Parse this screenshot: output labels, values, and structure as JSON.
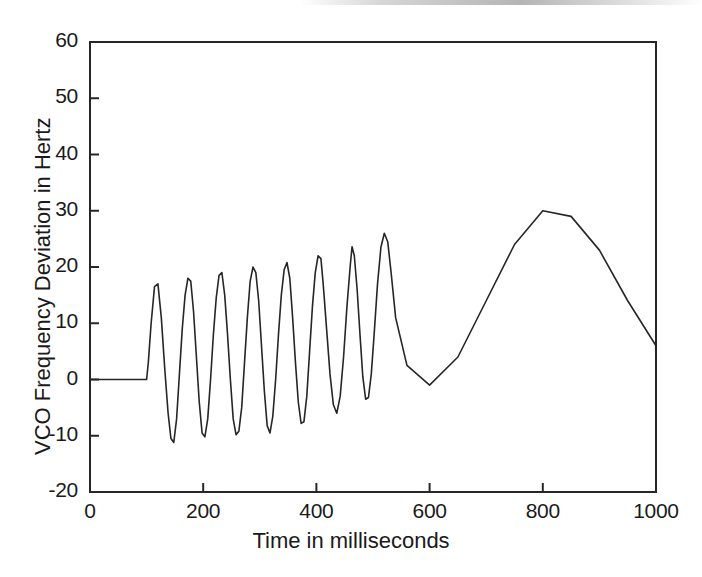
{
  "figure": {
    "width": 702,
    "height": 577,
    "background": "#ffffff",
    "line_color": "#262626",
    "axis_color": "#262626"
  },
  "chart_data": {
    "type": "line",
    "title": "",
    "xlabel": "Time in milliseconds",
    "ylabel": "VCO Frequency Deviation in Hertz",
    "xlim": [
      0,
      1000
    ],
    "ylim": [
      -20,
      60
    ],
    "xticks": [
      0,
      200,
      400,
      600,
      800,
      1000
    ],
    "xtick_labels": [
      "0",
      "200",
      "400",
      "600",
      "800",
      "1000"
    ],
    "yticks": [
      -20,
      -10,
      0,
      10,
      20,
      30,
      40,
      50,
      60
    ],
    "ytick_labels": [
      "-20",
      "-10",
      "0",
      "10",
      "20",
      "30",
      "40",
      "50",
      "60"
    ],
    "grid": false,
    "legend": null,
    "box": true,
    "series": [
      {
        "name": "VCO frequency deviation",
        "color": "#262626",
        "x": [
          0,
          20,
          40,
          60,
          80,
          100,
          103,
          108,
          114,
          120,
          126,
          132,
          138,
          143,
          148,
          153,
          158,
          163,
          168,
          173,
          178,
          183,
          188,
          193,
          198,
          203,
          208,
          213,
          218,
          223,
          228,
          233,
          238,
          243,
          248,
          253,
          258,
          263,
          268,
          273,
          278,
          283,
          288,
          293,
          298,
          303,
          308,
          313,
          318,
          323,
          328,
          333,
          338,
          343,
          348,
          353,
          358,
          363,
          368,
          373,
          378,
          383,
          388,
          393,
          398,
          403,
          408,
          412,
          418,
          424,
          430,
          436,
          442,
          448,
          454,
          460,
          463,
          467,
          472,
          477,
          482,
          487,
          492,
          497,
          502,
          508,
          514,
          520,
          526,
          532,
          540,
          560,
          600,
          650,
          700,
          750,
          800,
          850,
          900,
          950,
          1000
        ],
        "y": [
          0,
          0,
          0,
          0,
          0,
          0,
          3,
          10,
          16.5,
          17,
          11,
          2,
          -6,
          -10.5,
          -11.2,
          -7,
          1,
          9,
          15,
          18,
          17.5,
          12,
          4,
          -4,
          -9.5,
          -10.2,
          -7,
          0,
          8,
          14.5,
          18.5,
          19,
          15,
          8,
          0,
          -7,
          -9.8,
          -9.2,
          -5,
          3,
          11,
          17.5,
          20,
          19,
          14,
          6,
          -2,
          -8.2,
          -9.5,
          -6.5,
          0,
          8,
          15,
          19.5,
          20.8,
          18,
          11,
          3,
          -4,
          -7.8,
          -7.5,
          -3,
          5,
          13,
          19,
          22,
          21.5,
          17,
          9,
          1,
          -4.5,
          -6,
          -3,
          4,
          13,
          20.5,
          23.6,
          22,
          16,
          8,
          0.5,
          -3.5,
          -3.2,
          1,
          8,
          17,
          23.5,
          26,
          24.5,
          19,
          11,
          2.5,
          -1,
          4,
          14,
          24,
          30,
          29,
          23,
          14,
          6
        ],
        "y_note": "growing-oscillation phase 100-420 ms"
      }
    ],
    "annotations": [
      {
        "label": "zero-level plateau before lock acquisition",
        "x_range": [
          0,
          100
        ],
        "y": 0
      },
      {
        "label": "growing oscillation peaks (Hz)",
        "peaks": [
          17,
          18,
          19,
          20,
          20.8,
          22,
          23.6,
          26,
          30
        ]
      },
      {
        "label": "growing oscillation troughs (Hz)",
        "troughs": [
          -11.2,
          -10.2,
          -9.8,
          -9.5,
          -7.8,
          -6,
          -4.5,
          -3.5,
          -1,
          4
        ]
      },
      {
        "label": "overshoot peak",
        "x": 463,
        "y": 55
      },
      {
        "label": "undershoot dip",
        "x": 500,
        "y": 37.2
      },
      {
        "label": "settled value start",
        "x": 535,
        "y": 39.7
      },
      {
        "label": "settled value end",
        "x": 1000,
        "y": 39.2
      }
    ]
  }
}
